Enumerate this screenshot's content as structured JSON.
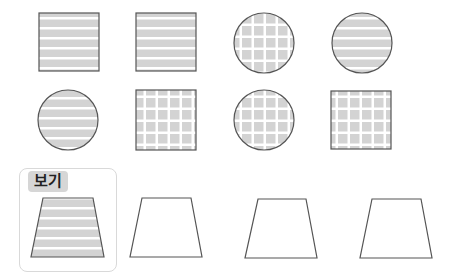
{
  "example": {
    "label": "보기"
  },
  "colors": {
    "fill": "#d3d3d3",
    "stroke": "#555555",
    "stripe": "#ffffff"
  },
  "shapes": [
    {
      "row": 1,
      "col": 1,
      "type": "square",
      "pattern": "horizontal-stripes"
    },
    {
      "row": 1,
      "col": 2,
      "type": "square",
      "pattern": "horizontal-stripes"
    },
    {
      "row": 1,
      "col": 3,
      "type": "circle",
      "pattern": "grid"
    },
    {
      "row": 1,
      "col": 4,
      "type": "circle",
      "pattern": "horizontal-stripes"
    },
    {
      "row": 2,
      "col": 1,
      "type": "circle",
      "pattern": "horizontal-stripes"
    },
    {
      "row": 2,
      "col": 2,
      "type": "square",
      "pattern": "grid"
    },
    {
      "row": 2,
      "col": 3,
      "type": "circle",
      "pattern": "grid"
    },
    {
      "row": 2,
      "col": 4,
      "type": "square",
      "pattern": "grid"
    },
    {
      "row": 3,
      "col": 1,
      "type": "trapezoid",
      "pattern": "horizontal-stripes",
      "is_example": true
    },
    {
      "row": 3,
      "col": 2,
      "type": "trapezoid",
      "pattern": "none"
    },
    {
      "row": 3,
      "col": 3,
      "type": "trapezoid",
      "pattern": "none"
    },
    {
      "row": 3,
      "col": 4,
      "type": "trapezoid",
      "pattern": "none"
    }
  ]
}
